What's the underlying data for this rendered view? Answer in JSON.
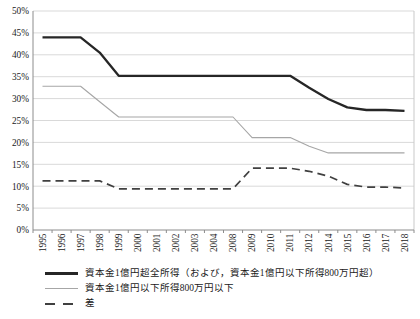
{
  "page": {
    "background": "#ffffff"
  },
  "chart_data": {
    "type": "line",
    "title": "",
    "xlabel": "",
    "ylabel": "",
    "ylim": [
      0,
      50
    ],
    "grid": true,
    "legend_position": "bottom-left",
    "axis_color": "#8c8c8c",
    "grid_color": "#d9d9d9",
    "border_color": "#c9c9c9",
    "label_color": "#1a1a1a",
    "categories": [
      "1995",
      "1996",
      "1997",
      "1998",
      "1999",
      "2000",
      "2001",
      "2002",
      "2003",
      "2004",
      "2008",
      "2009",
      "2010",
      "2011",
      "2012",
      "2014",
      "2015",
      "2016",
      "2017",
      "2018"
    ],
    "y_tick_values": [
      0,
      5,
      10,
      15,
      20,
      25,
      30,
      35,
      40,
      45,
      50
    ],
    "y_tick_labels": [
      "0%",
      "5%",
      "10%",
      "15%",
      "20%",
      "25%",
      "30%",
      "35%",
      "40%",
      "45%",
      "50%"
    ],
    "series": [
      {
        "name": "資本金1億円超全所得（および，資本金1億円以下所得800万円超）",
        "line_style": "solid-thick",
        "color": "#262626",
        "values": [
          44.0,
          44.0,
          44.0,
          40.5,
          35.2,
          35.2,
          35.2,
          35.2,
          35.2,
          35.2,
          35.2,
          35.2,
          35.2,
          35.2,
          32.5,
          29.9,
          28.0,
          27.4,
          27.4,
          27.2
        ]
      },
      {
        "name": "資本金1億円以下所得800万円以下",
        "line_style": "solid-thin",
        "color": "#a6a6a6",
        "values": [
          32.8,
          32.8,
          32.8,
          29.3,
          25.8,
          25.8,
          25.8,
          25.8,
          25.8,
          25.8,
          25.8,
          21.1,
          21.1,
          21.1,
          19.1,
          17.6,
          17.6,
          17.6,
          17.6,
          17.6
        ]
      },
      {
        "name": "差",
        "line_style": "dashed",
        "color": "#404040",
        "values": [
          11.2,
          11.2,
          11.2,
          11.2,
          9.4,
          9.4,
          9.4,
          9.4,
          9.4,
          9.4,
          9.4,
          14.1,
          14.1,
          14.1,
          13.4,
          12.3,
          10.4,
          9.8,
          9.8,
          9.6
        ]
      }
    ]
  }
}
